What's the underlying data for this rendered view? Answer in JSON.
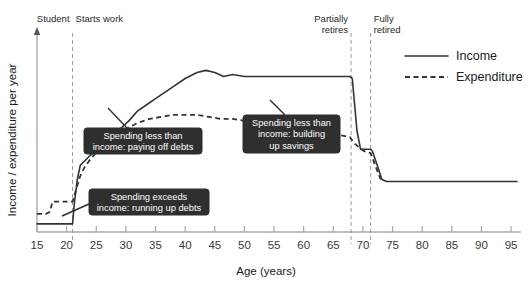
{
  "chart_data": {
    "type": "line",
    "title": "",
    "xlabel": "Age (years)",
    "ylabel": "Income / expenditure per year",
    "xlim": [
      15,
      96
    ],
    "ylim": [
      0,
      100
    ],
    "grid": false,
    "legend_position": "top-right",
    "xticks": [
      15,
      20,
      25,
      30,
      35,
      40,
      45,
      50,
      55,
      60,
      65,
      70,
      75,
      80,
      85,
      90,
      95
    ],
    "xtick_labels": [
      "15",
      "20",
      "25",
      "30",
      "35",
      "40",
      "45",
      "50",
      "55",
      "60",
      "65",
      "70",
      "75",
      "80",
      "85",
      "90",
      "95"
    ],
    "yticks": [],
    "ytick_labels": [],
    "series": [
      {
        "name": "Income",
        "style": "solid",
        "x": [
          15,
          17,
          19,
          21,
          21.3,
          21.8,
          22.3,
          23,
          24,
          25,
          26,
          27.5,
          29,
          30.5,
          32,
          33.5,
          35,
          36.5,
          38,
          40,
          42,
          43.5,
          45,
          46.5,
          48,
          50,
          52,
          54,
          56,
          58,
          60,
          62,
          64,
          66,
          67.8,
          68.2,
          69,
          69.6,
          70.2,
          71.3,
          71.6,
          72.3,
          73.2,
          74,
          80,
          88,
          96
        ],
        "y": [
          4,
          4,
          4,
          4,
          14,
          26,
          33,
          35,
          38,
          40,
          43,
          47,
          51,
          55,
          60,
          63,
          66,
          69,
          72,
          76,
          79,
          80,
          79,
          77,
          78,
          77,
          77,
          77,
          77,
          77,
          77,
          77,
          77,
          77,
          77,
          76,
          50,
          41,
          41,
          41,
          40,
          34,
          26,
          25,
          25,
          25,
          25
        ]
      },
      {
        "name": "Expenditure",
        "style": "dashed",
        "x": [
          15,
          16.5,
          17.2,
          17.6,
          19,
          21,
          21.5,
          22.2,
          23,
          24,
          25.5,
          27,
          28.5,
          30,
          32,
          34,
          36,
          38,
          40,
          42,
          44,
          46,
          48,
          50,
          52,
          54,
          56,
          58,
          60,
          62,
          64,
          66,
          67.8,
          68.5,
          69.3,
          70.2,
          71.3,
          72.2,
          73
        ],
        "y": [
          9,
          9,
          10,
          15,
          15,
          15,
          20,
          27,
          32,
          36,
          41,
          45,
          48,
          51,
          54,
          56,
          57,
          58,
          58,
          58,
          57,
          56,
          56,
          55,
          54,
          54,
          53,
          52,
          51,
          50,
          49,
          48,
          47,
          44,
          42,
          40,
          39,
          32,
          26
        ]
      }
    ],
    "events": [
      {
        "label_lines": [
          "Student"
        ],
        "x": 21,
        "label_x": 21,
        "label_anchor": "end"
      },
      {
        "label_lines": [
          "Starts work"
        ],
        "x": 21,
        "label_x": 21,
        "label_anchor": "start"
      },
      {
        "label_lines": [
          "Partially",
          "retires"
        ],
        "x": 68,
        "label_x": 68,
        "label_anchor": "end"
      },
      {
        "label_lines": [
          "Fully",
          "retired"
        ],
        "x": 71.3,
        "label_x": 71.3,
        "label_anchor": "start"
      }
    ],
    "annotations": [
      {
        "id": "paying-off-debts",
        "lines": [
          "Spending less than",
          "income: paying off debts"
        ],
        "box_x": 84,
        "box_y": 128,
        "box_w": 118,
        "box_h": 26,
        "leader_from_x": 127,
        "leader_from_y": 128,
        "leader_to_x": 108,
        "leader_to_y": 108
      },
      {
        "id": "running-up-debts",
        "lines": [
          "Spending exceeds",
          "income: running up debts"
        ],
        "box_x": 89,
        "box_y": 189,
        "box_w": 120,
        "box_h": 26,
        "leader_from_x": 89,
        "leader_from_y": 204,
        "leader_to_x": 62,
        "leader_to_y": 216
      },
      {
        "id": "building-up-savings",
        "lines": [
          "Spending less than",
          "income: building",
          "up savings"
        ],
        "box_x": 243,
        "box_y": 115,
        "box_w": 97,
        "box_h": 38,
        "leader_from_x": 285,
        "leader_from_y": 115,
        "leader_to_x": 270,
        "leader_to_y": 100
      }
    ],
    "legend": [
      {
        "name": "Income",
        "style": "solid"
      },
      {
        "name": "Expenditure",
        "style": "dashed"
      }
    ]
  }
}
